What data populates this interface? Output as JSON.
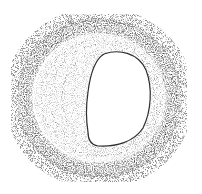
{
  "image": {
    "description": "Grayscale stippled pencil sketch of a circular vessel-like ring cross-section with an eccentric white opening",
    "colors": {
      "background": "#ffffff",
      "band_dark": "#4a4a4a",
      "band_mid": "#7a7a7a",
      "fill_light": "#c8c8c8",
      "stipple": "#6e6e6e",
      "lumen": "#ffffff",
      "lumen_outline": "#2e2e2e"
    },
    "shapes": {
      "outer_ring": {
        "cx": 99,
        "cy": 98,
        "rx": 76,
        "ry": 74,
        "thickness": 12
      },
      "inner_zone": {
        "cx": 100,
        "cy": 98,
        "rx": 64,
        "ry": 62
      },
      "lumen": {
        "x_min": 86,
        "x_max": 150,
        "y_min": 52,
        "y_max": 146
      }
    }
  }
}
